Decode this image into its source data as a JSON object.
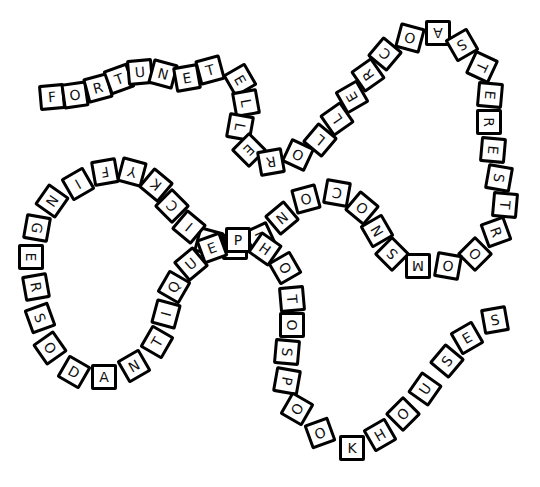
{
  "puzzle": {
    "title": "Word Path",
    "letters": "FORTUNETELLERROLLERCOASTERESTROOMSNOCONESTICKYFINGERSODANTIQUEPHOTOSPOOKHOUSES",
    "words": [
      "FORTUNE TELLER",
      "ROLLER COASTER",
      "RESTROOMS",
      "SNO CONES",
      "STICKY FINGERS",
      "SODA",
      "ANTIQUE",
      "PHOTOS",
      "SPOOK HOUSES"
    ],
    "tiles": [
      {
        "ch": "F",
        "x": 52,
        "y": 97,
        "r": -5
      },
      {
        "ch": "O",
        "x": 75,
        "y": 95,
        "r": -8
      },
      {
        "ch": "R",
        "x": 98,
        "y": 88,
        "r": -15
      },
      {
        "ch": "T",
        "x": 119,
        "y": 79,
        "r": -20
      },
      {
        "ch": "U",
        "x": 140,
        "y": 72,
        "r": -5
      },
      {
        "ch": "N",
        "x": 163,
        "y": 74,
        "r": 15
      },
      {
        "ch": "E",
        "x": 187,
        "y": 78,
        "r": -10
      },
      {
        "ch": "T",
        "x": 210,
        "y": 70,
        "r": -15
      },
      {
        "ch": "E",
        "x": 240,
        "y": 80,
        "r": 60
      },
      {
        "ch": "L",
        "x": 246,
        "y": 103,
        "r": 80
      },
      {
        "ch": "L",
        "x": 240,
        "y": 127,
        "r": 100
      },
      {
        "ch": "E",
        "x": 249,
        "y": 150,
        "r": 135
      },
      {
        "ch": "R",
        "x": 271,
        "y": 162,
        "r": 170
      },
      {
        "ch": "O",
        "x": 298,
        "y": 155,
        "r": -155
      },
      {
        "ch": "L",
        "x": 320,
        "y": 140,
        "r": -140
      },
      {
        "ch": "L",
        "x": 337,
        "y": 119,
        "r": -125
      },
      {
        "ch": "E",
        "x": 352,
        "y": 97,
        "r": -120
      },
      {
        "ch": "R",
        "x": 368,
        "y": 75,
        "r": -125
      },
      {
        "ch": "C",
        "x": 385,
        "y": 54,
        "r": -140
      },
      {
        "ch": "O",
        "x": 410,
        "y": 38,
        "r": -165
      },
      {
        "ch": "A",
        "x": 438,
        "y": 33,
        "r": 180
      },
      {
        "ch": "S",
        "x": 462,
        "y": 45,
        "r": 150
      },
      {
        "ch": "T",
        "x": 482,
        "y": 67,
        "r": 115
      },
      {
        "ch": "E",
        "x": 490,
        "y": 95,
        "r": 95
      },
      {
        "ch": "R",
        "x": 489,
        "y": 122,
        "r": 90
      },
      {
        "ch": "E",
        "x": 493,
        "y": 150,
        "r": 95
      },
      {
        "ch": "S",
        "x": 499,
        "y": 178,
        "r": 100
      },
      {
        "ch": "T",
        "x": 505,
        "y": 205,
        "r": 95
      },
      {
        "ch": "R",
        "x": 496,
        "y": 232,
        "r": 70
      },
      {
        "ch": "O",
        "x": 475,
        "y": 254,
        "r": 45
      },
      {
        "ch": "O",
        "x": 448,
        "y": 266,
        "r": 10
      },
      {
        "ch": "M",
        "x": 418,
        "y": 266,
        "r": 180
      },
      {
        "ch": "S",
        "x": 392,
        "y": 254,
        "r": -135
      },
      {
        "ch": "N",
        "x": 377,
        "y": 231,
        "r": -120
      },
      {
        "ch": "O",
        "x": 362,
        "y": 208,
        "r": -140
      },
      {
        "ch": "C",
        "x": 337,
        "y": 193,
        "r": -170
      },
      {
        "ch": "O",
        "x": 306,
        "y": 199,
        "r": 165
      },
      {
        "ch": "N",
        "x": 282,
        "y": 218,
        "r": 140
      },
      {
        "ch": "E",
        "x": 260,
        "y": 238,
        "r": 155
      },
      {
        "ch": "S",
        "x": 235,
        "y": 247,
        "r": 180
      },
      {
        "ch": "T",
        "x": 209,
        "y": 242,
        "r": -165
      },
      {
        "ch": "I",
        "x": 189,
        "y": 227,
        "r": -140
      },
      {
        "ch": "C",
        "x": 172,
        "y": 206,
        "r": -135
      },
      {
        "ch": "K",
        "x": 156,
        "y": 185,
        "r": -140
      },
      {
        "ch": "Y",
        "x": 132,
        "y": 172,
        "r": -165
      },
      {
        "ch": "F",
        "x": 105,
        "y": 172,
        "r": 170
      },
      {
        "ch": "I",
        "x": 78,
        "y": 184,
        "r": 150
      },
      {
        "ch": "N",
        "x": 52,
        "y": 201,
        "r": 125
      },
      {
        "ch": "G",
        "x": 37,
        "y": 228,
        "r": 100
      },
      {
        "ch": "E",
        "x": 31,
        "y": 257,
        "r": 90
      },
      {
        "ch": "R",
        "x": 36,
        "y": 287,
        "r": 80
      },
      {
        "ch": "S",
        "x": 40,
        "y": 318,
        "r": 70
      },
      {
        "ch": "O",
        "x": 50,
        "y": 348,
        "r": 55
      },
      {
        "ch": "D",
        "x": 74,
        "y": 372,
        "r": 30
      },
      {
        "ch": "A",
        "x": 104,
        "y": 377,
        "r": 0
      },
      {
        "ch": "N",
        "x": 134,
        "y": 366,
        "r": -30
      },
      {
        "ch": "T",
        "x": 157,
        "y": 342,
        "r": -60
      },
      {
        "ch": "I",
        "x": 166,
        "y": 314,
        "r": -75
      },
      {
        "ch": "Q",
        "x": 174,
        "y": 287,
        "r": -60
      },
      {
        "ch": "U",
        "x": 191,
        "y": 264,
        "r": -40
      },
      {
        "ch": "E",
        "x": 212,
        "y": 248,
        "r": -20
      },
      {
        "ch": "P",
        "x": 238,
        "y": 240,
        "r": 0
      },
      {
        "ch": "H",
        "x": 265,
        "y": 249,
        "r": 35
      },
      {
        "ch": "O",
        "x": 285,
        "y": 268,
        "r": 60
      },
      {
        "ch": "T",
        "x": 292,
        "y": 299,
        "r": 85
      },
      {
        "ch": "O",
        "x": 292,
        "y": 325,
        "r": 90
      },
      {
        "ch": "S",
        "x": 287,
        "y": 352,
        "r": 95
      },
      {
        "ch": "P",
        "x": 287,
        "y": 381,
        "r": 100
      },
      {
        "ch": "O",
        "x": 297,
        "y": 409,
        "r": 120
      },
      {
        "ch": "O",
        "x": 320,
        "y": 433,
        "r": 160
      },
      {
        "ch": "K",
        "x": 352,
        "y": 448,
        "r": 0
      },
      {
        "ch": "H",
        "x": 380,
        "y": 435,
        "r": -30
      },
      {
        "ch": "O",
        "x": 403,
        "y": 414,
        "r": -45
      },
      {
        "ch": "U",
        "x": 425,
        "y": 389,
        "r": -55
      },
      {
        "ch": "S",
        "x": 447,
        "y": 361,
        "r": -50
      },
      {
        "ch": "E",
        "x": 467,
        "y": 338,
        "r": -30
      },
      {
        "ch": "S",
        "x": 495,
        "y": 320,
        "r": -10
      }
    ]
  }
}
